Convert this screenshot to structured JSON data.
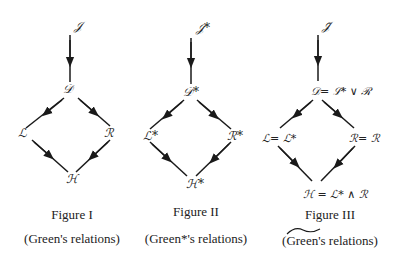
{
  "figures": [
    {
      "title": "Figure I",
      "subtitle": "(Green's relations)",
      "nodes": {
        "top": "𝒥",
        "d": "𝒟",
        "l": "ℒ",
        "r": "ℛ",
        "h": "ℋ"
      }
    },
    {
      "title": "Figure II",
      "subtitle": "(Green*'s relations)",
      "nodes": {
        "top": "𝒥*",
        "d": "𝒟*",
        "l": "ℒ*",
        "r": "ℛ*",
        "h": "ℋ*"
      }
    },
    {
      "title": "Figure III",
      "subtitle": "(Green's relations)",
      "subtitle_mark": "tilde",
      "nodes": {
        "top": "𝒥̃",
        "d": "𝒟= ℒ* ∨ ℛ",
        "l": "ℒ= ℒ*",
        "r": "ℛ= ℛ",
        "h": "ℋ = ℒ* ∧ ℛ"
      }
    }
  ],
  "colors": {
    "ink": "#1a1a1a",
    "background": "#ffffff"
  }
}
